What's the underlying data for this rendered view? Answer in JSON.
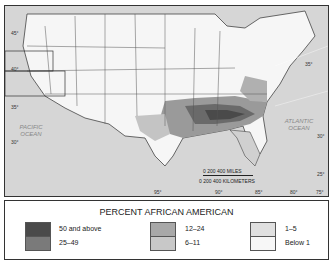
{
  "map": {
    "latitude_labels": [
      "45°",
      "40°",
      "35°",
      "30°",
      "35°",
      "30°",
      "25°"
    ],
    "longitude_labels": [
      "95°",
      "90°",
      "85°",
      "80°",
      "75°"
    ],
    "oceans": {
      "pacific": "PACIFIC\nOCEAN",
      "atlantic": "ATLANTIC\nOCEAN"
    },
    "scale": {
      "miles_ticks": "0    200    400 MILES",
      "km_ticks": "0  200  400 KILOMETERS"
    },
    "inset_alaska_label": "400 MILES / 400 KILOMETERS",
    "inset_hawaii_label": "200 MILES / 200 KILOMETERS"
  },
  "legend": {
    "title": "PERCENT AFRICAN AMERICAN",
    "items": [
      {
        "label": "50 and above",
        "color": "#4a4a4a"
      },
      {
        "label": "25–49",
        "color": "#7a7a7a"
      },
      {
        "label": "12–24",
        "color": "#a8a8a8"
      },
      {
        "label": "6–11",
        "color": "#c8c8c8"
      },
      {
        "label": "1–5",
        "color": "#e0e0e0"
      },
      {
        "label": "Below 1",
        "color": "#f7f7f7"
      }
    ]
  }
}
